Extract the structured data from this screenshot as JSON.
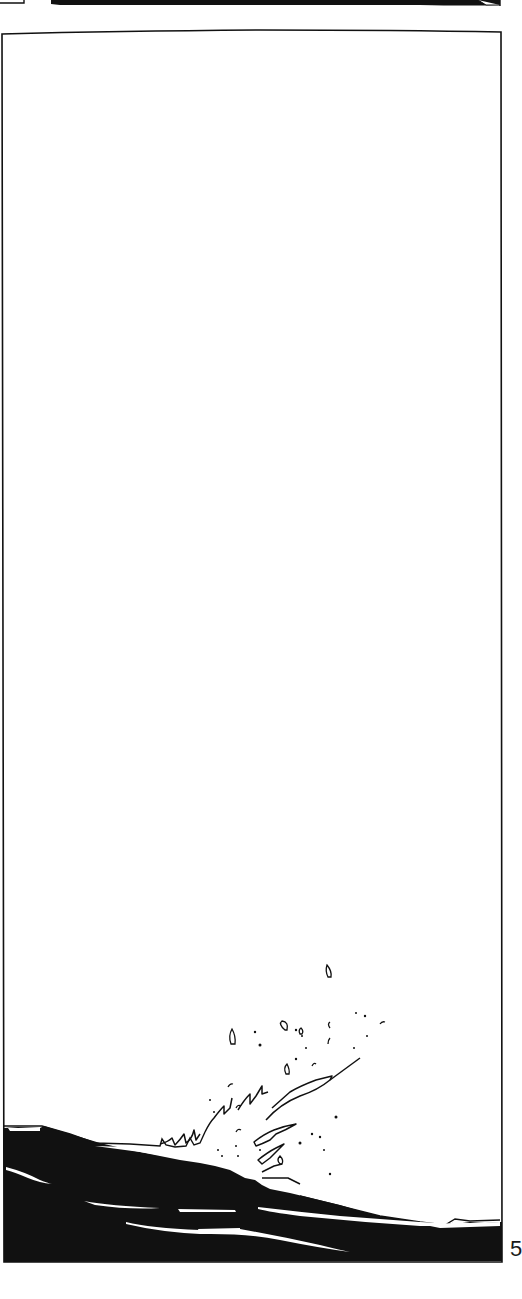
{
  "page": {
    "type": "comic-page",
    "page_number": "5",
    "colors": {
      "ink": "#111111",
      "paper": "#ffffff"
    }
  },
  "panels": [
    {
      "id": "previous-panel-left-sliver",
      "description": "bottom edge of a small bordered panel at top-left"
    },
    {
      "id": "previous-panel-dark-sliver",
      "description": "bottom edge of a dark (black-filled) panel at top"
    },
    {
      "id": "main-panel",
      "description": "tall panel: empty white sky, dark sea at bottom with a splash of water droplets",
      "elements": [
        "sky",
        "dark-water",
        "water-streaks",
        "splash",
        "droplets"
      ]
    }
  ]
}
